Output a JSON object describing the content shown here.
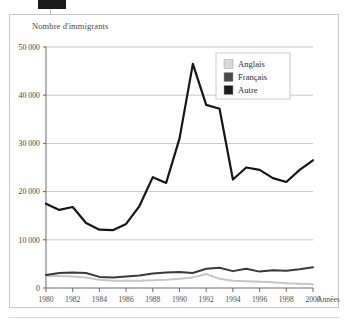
{
  "figure": {
    "title": "Nombre d'immigrants",
    "x_axis_name": "Années",
    "artifact_label": ""
  },
  "legend": {
    "position": "top-right-inside",
    "items": [
      {
        "label": "Anglais",
        "color": "#d9d9d9"
      },
      {
        "label": "Français",
        "color": "#4a4a4a"
      },
      {
        "label": "Autre",
        "color": "#1c1c1c"
      }
    ]
  },
  "axes": {
    "y_ticks": [
      "0",
      "10 000",
      "20 000",
      "30 000",
      "40 000",
      "50 000"
    ],
    "x_ticks": [
      "1980",
      "1982",
      "1984",
      "1986",
      "1988",
      "1990",
      "1992",
      "1994",
      "1996",
      "1998",
      "2000"
    ]
  },
  "colors": {
    "frame": "#c9c9c9",
    "gridline": "#9a9a9a",
    "axis": "#5a5a5a",
    "anglais": "#c6c6c6",
    "francais": "#3a3a3a",
    "autre": "#161616",
    "title_text": "#4a4a4a"
  },
  "chart_data": {
    "type": "line",
    "title": "Nombre d'immigrants",
    "xlabel": "Années",
    "ylabel": "Nombre d'immigrants",
    "xlim": [
      1980,
      2000
    ],
    "ylim": [
      0,
      50000
    ],
    "ytick_step": 10000,
    "xtick_step": 2,
    "grid": true,
    "legend_position": "upper right",
    "x": [
      1980,
      1981,
      1982,
      1983,
      1984,
      1985,
      1986,
      1987,
      1988,
      1989,
      1990,
      1991,
      1992,
      1993,
      1994,
      1995,
      1996,
      1997,
      1998,
      1999,
      2000
    ],
    "series": [
      {
        "name": "Autre",
        "color": "#161616",
        "values": [
          17500,
          16200,
          16800,
          13500,
          12100,
          12000,
          13300,
          17000,
          23000,
          21800,
          31000,
          46500,
          38000,
          37200,
          22500,
          25000,
          24500,
          22800,
          22000,
          24500,
          26500
        ]
      },
      {
        "name": "Français",
        "color": "#3a3a3a",
        "values": [
          2700,
          3100,
          3200,
          3100,
          2300,
          2200,
          2400,
          2600,
          3000,
          3200,
          3300,
          3100,
          4000,
          4200,
          3500,
          4000,
          3400,
          3700,
          3600,
          3900,
          4300
        ]
      },
      {
        "name": "Anglais",
        "color": "#c6c6c6",
        "values": [
          2500,
          2500,
          2400,
          2200,
          1700,
          1500,
          1500,
          1500,
          1600,
          1700,
          1900,
          2200,
          2900,
          1900,
          1500,
          1400,
          1300,
          1200,
          1000,
          900,
          800
        ]
      }
    ]
  }
}
